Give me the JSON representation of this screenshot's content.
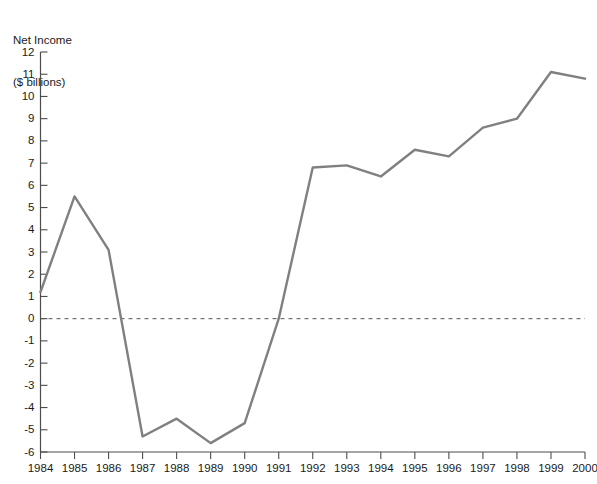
{
  "chart_data": {
    "type": "line",
    "title": "Net Income\n($ billions)",
    "title_lines": [
      "Net Income",
      "($ billions)"
    ],
    "xlabel": "",
    "ylabel": "Net Income ($ billions)",
    "categories": [
      "1984",
      "1985",
      "1986",
      "1987",
      "1988",
      "1989",
      "1990",
      "1991",
      "1992",
      "1993",
      "1994",
      "1995",
      "1996",
      "1997",
      "1998",
      "1999",
      "2000"
    ],
    "x": [
      1984,
      1985,
      1986,
      1987,
      1988,
      1989,
      1990,
      1991,
      1992,
      1993,
      1994,
      1995,
      1996,
      1997,
      1998,
      1999,
      2000
    ],
    "values": [
      1.2,
      5.5,
      3.1,
      -5.3,
      -4.5,
      -5.6,
      -4.7,
      0.0,
      6.8,
      6.9,
      6.4,
      7.6,
      7.3,
      8.6,
      9.0,
      11.1,
      10.8
    ],
    "series": [
      {
        "name": "Net Income",
        "color": "#808080",
        "values": [
          1.2,
          5.5,
          3.1,
          -5.3,
          -4.5,
          -5.6,
          -4.7,
          0.0,
          6.8,
          6.9,
          6.4,
          7.6,
          7.3,
          8.6,
          9.0,
          11.1,
          10.8
        ]
      }
    ],
    "ylim": [
      -6,
      12
    ],
    "xlim": [
      1984,
      2000
    ],
    "yticks": [
      12,
      11,
      10,
      9,
      8,
      7,
      6,
      5,
      4,
      3,
      2,
      1,
      0,
      -1,
      -2,
      -3,
      -4,
      -5,
      -6
    ],
    "ytick_labels": [
      "12",
      "11",
      "10",
      "9",
      "8",
      "7",
      "6",
      "5",
      "4",
      "3",
      "2",
      "1",
      "0",
      "-1",
      "-2",
      "-3",
      "-4",
      "-5",
      "-6"
    ],
    "xtick_labels": [
      "1984",
      "1985",
      "1986",
      "1987",
      "1988",
      "1989",
      "1990",
      "1991",
      "1992",
      "1993",
      "1994",
      "1995",
      "1996",
      "1997",
      "1998",
      "1999",
      "2000"
    ],
    "grid": false,
    "legend": null,
    "zero_reference_line": {
      "value": 0,
      "style": "dashed",
      "color": "#555555"
    },
    "line_color": "#808080",
    "axis_color": "#4d4d4d",
    "background": "#ffffff"
  }
}
